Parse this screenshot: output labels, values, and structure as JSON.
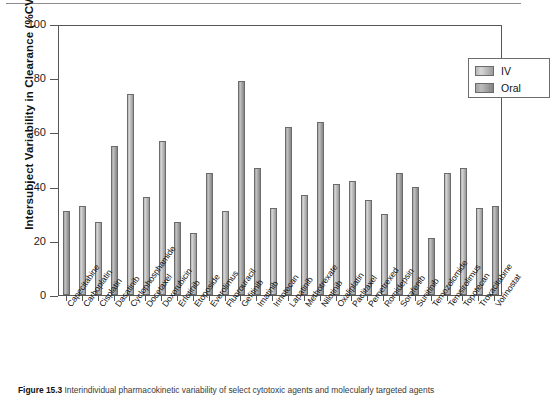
{
  "figure": {
    "caption_label": "Figure 15.3",
    "caption_text": "Interindividual pharmacokinetic variability of select cytotoxic agents and molecularly targeted agents"
  },
  "legend": {
    "position": "top-right",
    "entries": [
      {
        "label": "IV",
        "color": "#bdbdbd"
      },
      {
        "label": "Oral",
        "color": "#9e9e9e"
      }
    ]
  },
  "chart_data": {
    "type": "bar",
    "title": "",
    "xlabel": "",
    "ylabel": "Intersubject Variability in Clearance (%CV)",
    "ylim": [
      0,
      100
    ],
    "yticks": [
      0,
      20,
      40,
      60,
      80,
      100
    ],
    "grid": false,
    "legend_position": "upper right",
    "categories": [
      "Capecitabine",
      "Carboplatin",
      "Cisplatin",
      "Dasatinib",
      "Cyclophosphamide",
      "Docetaxel",
      "Doxorubicin",
      "Erlotinib",
      "Etoposide",
      "Everolimus",
      "Fluorouracil",
      "Gefitinib",
      "Imatinib",
      "Irinotecan",
      "Lapatinib",
      "Methotrexate",
      "Nilotinib",
      "Oxaliplatin",
      "Paclitaxel",
      "Pemetrexed",
      "Romidepsin",
      "Sorafenib",
      "Sunitinib",
      "Temozolomide",
      "Temsirolimus",
      "Topotecan",
      "Troxacitabine",
      "Vorinostat"
    ],
    "values": [
      31,
      33,
      27,
      55,
      74,
      36,
      57,
      27,
      23,
      45,
      31,
      79,
      47,
      32,
      62,
      37,
      64,
      41,
      42,
      35,
      30,
      45,
      40,
      21,
      45,
      47,
      32,
      33
    ],
    "routes": [
      "Oral",
      "IV",
      "IV",
      "Oral",
      "IV",
      "IV",
      "IV",
      "Oral",
      "IV",
      "Oral",
      "IV",
      "Oral",
      "Oral",
      "IV",
      "Oral",
      "IV",
      "Oral",
      "IV",
      "IV",
      "IV",
      "IV",
      "Oral",
      "Oral",
      "Oral",
      "IV",
      "IV",
      "IV",
      "Oral"
    ]
  }
}
